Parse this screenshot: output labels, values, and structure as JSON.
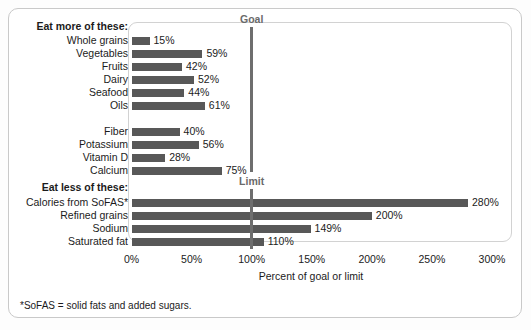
{
  "chart_data": {
    "type": "bar",
    "orientation": "horizontal",
    "title": "",
    "xlabel": "Percent of goal or limit",
    "ylabel": "",
    "xlim": [
      0,
      300
    ],
    "xticks": [
      "0%",
      "50%",
      "100%",
      "150%",
      "200%",
      "250%",
      "300%"
    ],
    "xtick_values": [
      0,
      50,
      100,
      150,
      200,
      250,
      300
    ],
    "grid": false,
    "legend": "none",
    "bar_color": "#585858",
    "reference_line_color": "#6e6e6e",
    "groups": [
      {
        "heading": "Eat more of these:",
        "reference_label": "Goal",
        "reference_value": 100,
        "categories": [
          "Whole grains",
          "Vegetables",
          "Fruits",
          "Dairy",
          "Seafood",
          "Oils",
          "Fiber",
          "Potassium",
          "Vitamin D",
          "Calcium"
        ],
        "values": [
          15,
          59,
          42,
          52,
          44,
          61,
          40,
          56,
          28,
          75
        ],
        "labels": [
          "15%",
          "59%",
          "42%",
          "52%",
          "44%",
          "61%",
          "40%",
          "56%",
          "28%",
          "75%"
        ]
      },
      {
        "heading": "Eat less of these:",
        "reference_label": "Limit",
        "reference_value": 100,
        "categories": [
          "Calories from SoFAS*",
          "Refined grains",
          "Sodium",
          "Saturated fat"
        ],
        "values": [
          280,
          200,
          149,
          110
        ],
        "labels": [
          "280%",
          "200%",
          "149%",
          "110%"
        ]
      }
    ],
    "footnote": "*SoFAS = solid fats and added sugars."
  },
  "rows": [
    {
      "name": "group-heading-more",
      "kind": "heading",
      "label": "Eat more of these:",
      "y": 20
    },
    {
      "name": "row-whole-grains",
      "kind": "bar",
      "label": "Whole grains",
      "value": 15,
      "value_label": "15%",
      "y": 34
    },
    {
      "name": "row-vegetables",
      "kind": "bar",
      "label": "Vegetables",
      "value": 59,
      "value_label": "59%",
      "y": 47
    },
    {
      "name": "row-fruits",
      "kind": "bar",
      "label": "Fruits",
      "value": 42,
      "value_label": "42%",
      "y": 60
    },
    {
      "name": "row-dairy",
      "kind": "bar",
      "label": "Dairy",
      "value": 52,
      "value_label": "52%",
      "y": 73
    },
    {
      "name": "row-seafood",
      "kind": "bar",
      "label": "Seafood",
      "value": 44,
      "value_label": "44%",
      "y": 86
    },
    {
      "name": "row-oils",
      "kind": "bar",
      "label": "Oils",
      "value": 61,
      "value_label": "61%",
      "y": 99
    },
    {
      "name": "row-fiber",
      "kind": "bar",
      "label": "Fiber",
      "value": 40,
      "value_label": "40%",
      "y": 125
    },
    {
      "name": "row-potassium",
      "kind": "bar",
      "label": "Potassium",
      "value": 56,
      "value_label": "56%",
      "y": 138
    },
    {
      "name": "row-vitamin-d",
      "kind": "bar",
      "label": "Vitamin D",
      "value": 28,
      "value_label": "28%",
      "y": 151
    },
    {
      "name": "row-calcium",
      "kind": "bar",
      "label": "Calcium",
      "value": 75,
      "value_label": "75%",
      "y": 164
    },
    {
      "name": "group-heading-less",
      "kind": "heading",
      "label": "Eat less of these:",
      "y": 181
    },
    {
      "name": "row-calories-from-sofas",
      "kind": "bar",
      "label": "Calories from SoFAS*",
      "value": 280,
      "value_label": "280%",
      "y": 196
    },
    {
      "name": "row-refined-grains",
      "kind": "bar",
      "label": "Refined grains",
      "value": 200,
      "value_label": "200%",
      "y": 209
    },
    {
      "name": "row-sodium",
      "kind": "bar",
      "label": "Sodium",
      "value": 149,
      "value_label": "149%",
      "y": 222
    },
    {
      "name": "row-saturated-fat",
      "kind": "bar",
      "label": "Saturated fat",
      "value": 110,
      "value_label": "110%",
      "y": 235
    }
  ],
  "reference_lines": [
    {
      "name": "goal-line",
      "label": "Goal",
      "value": 100,
      "y_top": 27,
      "y_bottom": 172
    },
    {
      "name": "limit-line",
      "label": "Limit",
      "value": 100,
      "y_top": 189,
      "y_bottom": 249
    }
  ],
  "axis": {
    "title": "Percent of goal or limit",
    "ticks": [
      "0%",
      "50%",
      "100%",
      "150%",
      "200%",
      "250%",
      "300%"
    ],
    "tick_values": [
      0,
      50,
      100,
      150,
      200,
      250,
      300
    ]
  },
  "footnote": "*SoFAS = solid fats and added sugars."
}
